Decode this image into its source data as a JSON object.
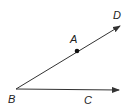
{
  "diagram": {
    "title": "",
    "type": "angle-with-rays",
    "colors": {
      "stroke": "#333333",
      "text": "#222222",
      "background": "#ffffff"
    },
    "points": [
      {
        "id": "B",
        "label": "B",
        "x": 16,
        "y": 89,
        "label_x": 8,
        "label_y": 103,
        "role": "vertex"
      },
      {
        "id": "A",
        "label": "A",
        "x": 77,
        "y": 51,
        "label_x": 70,
        "label_y": 43,
        "role": "point-on-ray",
        "dot": true
      },
      {
        "id": "D",
        "label": "D",
        "x": 120,
        "y": 26,
        "label_x": 113,
        "label_y": 19,
        "role": "ray-endpoint"
      },
      {
        "id": "C",
        "label": "C",
        "x": 119,
        "y": 90,
        "label_x": 84,
        "label_y": 104,
        "role": "ray-endpoint"
      }
    ],
    "rays": [
      {
        "from": "B",
        "through": "A",
        "to": "D",
        "arrow": true
      },
      {
        "from": "B",
        "to": "C",
        "arrow": true
      }
    ]
  }
}
